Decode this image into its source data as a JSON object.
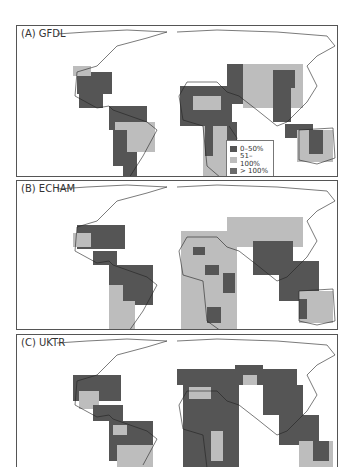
{
  "figure": {
    "panels": [
      {
        "id": "A",
        "label": "(A) GFDL"
      },
      {
        "id": "B",
        "label": "(B) ECHAM"
      },
      {
        "id": "C",
        "label": "(C) UKTR"
      }
    ],
    "legend": {
      "items": [
        {
          "label": "0–50%",
          "color": "#555555"
        },
        {
          "label": "51–100%",
          "color": "#bdbdbd"
        },
        {
          "label": "> 100%",
          "color": "#6a6a6a"
        }
      ]
    }
  },
  "colors": {
    "dark": "#555555",
    "light": "#bdbdbd",
    "outline": "#222222"
  }
}
